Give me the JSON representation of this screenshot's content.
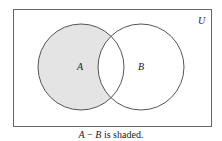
{
  "diagram": {
    "universe_label": "U",
    "set_a_label": "A",
    "set_b_label": "B",
    "shaded_region": "A - B",
    "shade_color": "#e4e4e4",
    "stroke_color": "#555555"
  },
  "caption": {
    "expr_a": "A",
    "expr_op": " − ",
    "expr_b": "B",
    "text": " is shaded."
  }
}
